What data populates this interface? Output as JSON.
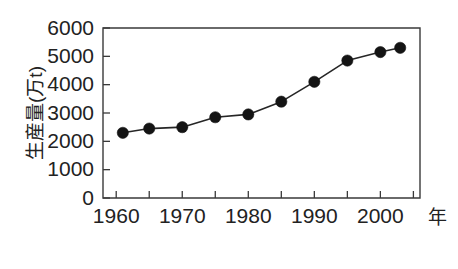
{
  "chart_data": {
    "type": "line",
    "title": "",
    "subtitle": "",
    "xlabel": "年",
    "ylabel": "生産量(万t)",
    "x": [
      1961,
      1965,
      1970,
      1975,
      1980,
      1985,
      1990,
      1995,
      2000,
      2003
    ],
    "values": [
      2300,
      2450,
      2500,
      2850,
      2950,
      3400,
      4100,
      4850,
      5150,
      5300
    ],
    "series": [
      {
        "name": "生産量",
        "values": [
          2300,
          2450,
          2500,
          2850,
          2950,
          3400,
          4100,
          4850,
          5150,
          5300
        ]
      }
    ],
    "xlim": [
      1958,
      2006
    ],
    "ylim": [
      0,
      6000
    ],
    "x_tick_labels": [
      "1960",
      "1970",
      "1980",
      "1990",
      "2000"
    ],
    "x_tick_values": [
      1960,
      1970,
      1980,
      1990,
      2000
    ],
    "x_minor_tick_values": [
      1960,
      1965,
      1970,
      1975,
      1980,
      1985,
      1990,
      1995,
      2000,
      2005
    ],
    "y_tick_labels": [
      "0",
      "1000",
      "2000",
      "3000",
      "4000",
      "5000",
      "6000"
    ],
    "y_tick_values": [
      0,
      1000,
      2000,
      3000,
      4000,
      5000,
      6000
    ],
    "grid": false,
    "legend": false,
    "legend_position": "none",
    "marker": "filled-circle",
    "line_color": "#262626",
    "marker_color": "#141414",
    "axis_color": "#3a3a3a",
    "background_color": "#ffffff"
  }
}
